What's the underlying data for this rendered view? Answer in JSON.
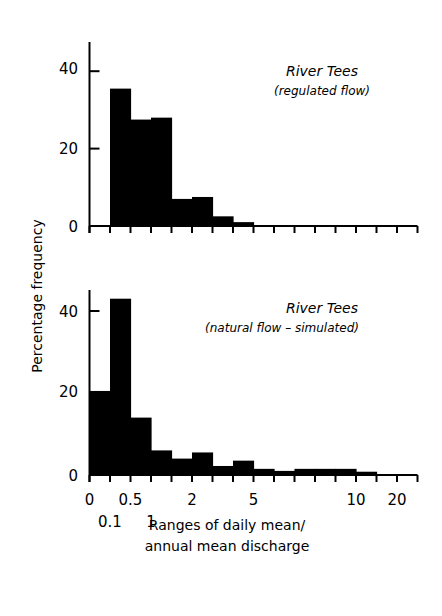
{
  "chart_data": [
    {
      "type": "bar",
      "panel": "top",
      "title": "River Tees",
      "subtitle": "(regulated flow)",
      "xlabel": "Ranges of daily mean/ annual mean discharge",
      "ylabel": "Percentage frequency",
      "ylim": [
        0,
        46
      ],
      "yticks": [
        0,
        20,
        40
      ],
      "bins": 16,
      "values": [
        0,
        35.5,
        27.5,
        28,
        7,
        7.5,
        2.5,
        1,
        0,
        0,
        0,
        0,
        0,
        0,
        0,
        0
      ]
    },
    {
      "type": "bar",
      "panel": "bottom",
      "title": "River Tees",
      "subtitle": "(natural flow - simulated)",
      "xlabel": "Ranges of daily mean/ annual mean discharge",
      "ylabel": "Percentage frequency",
      "ylim": [
        0,
        45
      ],
      "yticks": [
        0,
        20,
        40
      ],
      "bins": 16,
      "values": [
        20.5,
        43,
        14,
        6,
        4,
        5.5,
        2.2,
        3.5,
        1.5,
        1,
        1.5,
        1.5,
        1.5,
        0.8,
        0,
        0
      ],
      "xtick_labels_row1": [
        {
          "bin_edge": 0,
          "label": "0"
        },
        {
          "bin_edge": 2,
          "label": "0.5"
        },
        {
          "bin_edge": 5,
          "label": "2"
        },
        {
          "bin_edge": 8,
          "label": "5"
        },
        {
          "bin_edge": 13,
          "label": "10"
        },
        {
          "bin_edge": 15,
          "label": "20"
        }
      ],
      "xtick_labels_row2": [
        {
          "bin_edge": 1,
          "label": "0.1"
        },
        {
          "bin_edge": 3,
          "label": "1"
        }
      ]
    }
  ],
  "labels": {
    "ylabel": "Percentage frequency",
    "xlabel_line1": "Ranges of daily mean/",
    "xlabel_line2": "annual mean discharge",
    "top_title": "River Tees",
    "top_subtitle": "(regulated flow)",
    "bottom_title": "River Tees",
    "bottom_subtitle": "(natural flow – simulated)",
    "ytick_0": "0",
    "ytick_20": "20",
    "ytick_40": "40"
  }
}
